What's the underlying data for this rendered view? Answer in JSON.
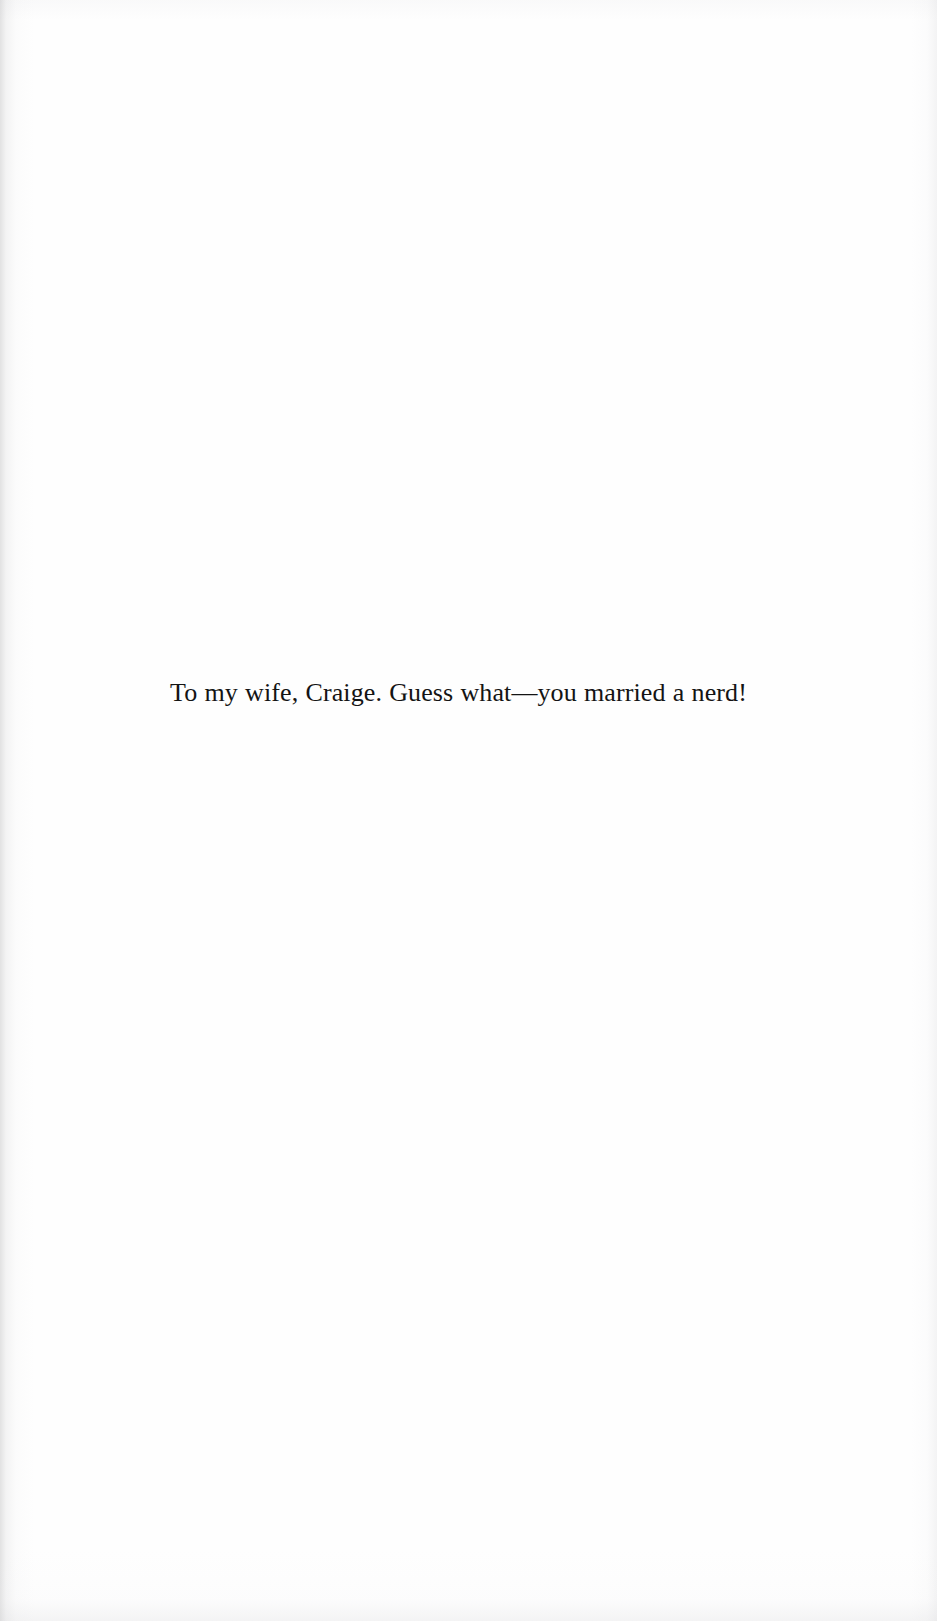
{
  "page": {
    "kind": "book-dedication-page",
    "background_color": "#fefefe",
    "text_color": "#141414"
  },
  "dedication": {
    "text": "To my wife, Craige. Guess what—you married a nerd!"
  }
}
